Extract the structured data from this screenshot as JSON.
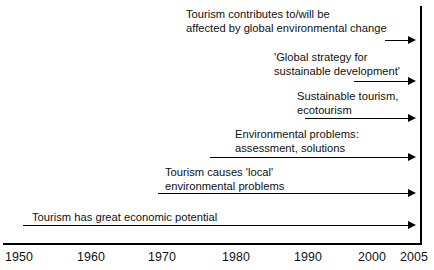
{
  "diagram": {
    "type": "timeline",
    "title": "",
    "rows": [
      {
        "id": "global-environmental-change",
        "label": "Tourism contributes to/will be\naffected by global environmental change",
        "label_x": 186,
        "label_y": 8,
        "arrow_start_x": 385,
        "arrow_end_x": 416,
        "arrow_y": 40,
        "start_year": 2002,
        "end_year": 2005
      },
      {
        "id": "global-strategy-sustainable-development",
        "label": "'Global strategy for\nsustainable development'",
        "label_x": 274,
        "label_y": 51,
        "arrow_start_x": 354,
        "arrow_end_x": 416,
        "arrow_y": 81,
        "start_year": 1998,
        "end_year": 2005
      },
      {
        "id": "sustainable-tourism-ecotourism",
        "label": "Sustainable tourism,\necotourism",
        "label_x": 297,
        "label_y": 90,
        "arrow_start_x": 305,
        "arrow_end_x": 416,
        "arrow_y": 118,
        "start_year": 1991,
        "end_year": 2005
      },
      {
        "id": "environmental-problems-assessment-solutions",
        "label": "Environmental problems:\nassessment, solutions",
        "label_x": 235,
        "label_y": 128,
        "arrow_start_x": 210,
        "arrow_end_x": 416,
        "arrow_y": 157,
        "start_year": 1978,
        "end_year": 2005
      },
      {
        "id": "tourism-causes-local-environmental-problems",
        "label": "Tourism causes 'local'\nenvironmental problems",
        "label_x": 165,
        "label_y": 166,
        "arrow_start_x": 158,
        "arrow_end_x": 416,
        "arrow_y": 193,
        "start_year": 1971,
        "end_year": 2005
      },
      {
        "id": "tourism-has-great-economic-potential",
        "label": "Tourism has great economic potential",
        "label_x": 32,
        "label_y": 211,
        "arrow_start_x": 23,
        "arrow_end_x": 416,
        "arrow_y": 225,
        "start_year": 1952,
        "end_year": 2005
      }
    ],
    "axis": {
      "label": "",
      "ticks": [
        {
          "label": "1950",
          "x": 5
        },
        {
          "label": "1960",
          "x": 77
        },
        {
          "label": "1970",
          "x": 148
        },
        {
          "label": "1980",
          "x": 222
        },
        {
          "label": "1990",
          "x": 294
        },
        {
          "label": "2000",
          "x": 358
        },
        {
          "label": "2005",
          "x": 400
        }
      ]
    },
    "colors": {
      "ink": "#000000",
      "background": "#ffffff"
    }
  }
}
